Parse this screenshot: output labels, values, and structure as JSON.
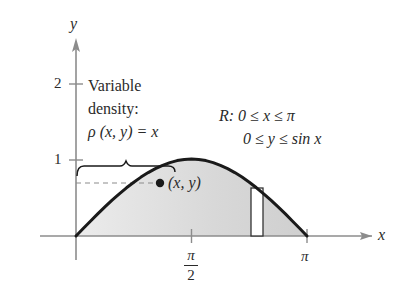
{
  "figure": {
    "axes": {
      "x_label": "x",
      "y_label": "y",
      "y_ticks": [
        {
          "value": 1,
          "label": "1"
        },
        {
          "value": 2,
          "label": "2"
        }
      ],
      "x_ticks": [
        {
          "value": "pi/2",
          "numerator": "π",
          "denominator": "2"
        },
        {
          "value": "pi",
          "label": "π"
        }
      ]
    },
    "density_annotation": {
      "line1": "Variable",
      "line2": "density:",
      "line3": "ρ (x, y) = x"
    },
    "region_annotation": {
      "line1": "R: 0 ≤ x ≤ π",
      "line2": "0 ≤ y ≤ sin x"
    },
    "point_label": "(x, y)",
    "curve": "y = sin x",
    "colors": {
      "axis": "#8c8c8c",
      "curve": "#1a1a1a",
      "region_fill": "#d9d9d9",
      "text": "#2a2a2a",
      "rectangle_fill": "#ffffff"
    }
  }
}
